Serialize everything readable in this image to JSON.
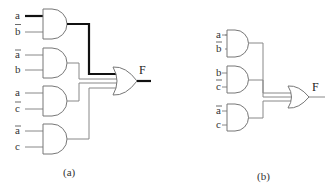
{
  "diagram": {
    "type": "logic-circuit-comparison",
    "panels": [
      {
        "caption": "(a)",
        "output_label": "F",
        "and_gates": [
          {
            "inputs": [
              {
                "label": "a",
                "complemented": false
              },
              {
                "label": "b",
                "complemented": true
              }
            ],
            "highlighted": true
          },
          {
            "inputs": [
              {
                "label": "a",
                "complemented": true
              },
              {
                "label": "b",
                "complemented": false
              }
            ],
            "highlighted": false
          },
          {
            "inputs": [
              {
                "label": "a",
                "complemented": false
              },
              {
                "label": "c",
                "complemented": true
              }
            ],
            "highlighted": false
          },
          {
            "inputs": [
              {
                "label": "a",
                "complemented": true
              },
              {
                "label": "c",
                "complemented": false
              }
            ],
            "highlighted": false
          }
        ],
        "or_gate_inputs": 4
      },
      {
        "caption": "(b)",
        "output_label": "F",
        "and_gates": [
          {
            "inputs": [
              {
                "label": "a",
                "complemented": false
              },
              {
                "label": "b",
                "complemented": true
              }
            ]
          },
          {
            "inputs": [
              {
                "label": "b",
                "complemented": false
              },
              {
                "label": "c",
                "complemented": true
              }
            ]
          },
          {
            "inputs": [
              {
                "label": "a",
                "complemented": true
              },
              {
                "label": "c",
                "complemented": false
              }
            ]
          }
        ],
        "or_gate_inputs": 3
      }
    ]
  },
  "panel_a": {
    "caption": "(a)",
    "output": "F",
    "g1": {
      "in1": "a",
      "in2": "b"
    },
    "g2": {
      "in1": "a",
      "in2": "b"
    },
    "g3": {
      "in1": "a",
      "in2": "c"
    },
    "g4": {
      "in1": "a",
      "in2": "c"
    }
  },
  "panel_b": {
    "caption": "(b)",
    "output": "F",
    "g1": {
      "in1": "a",
      "in2": "b"
    },
    "g2": {
      "in1": "b",
      "in2": "c"
    },
    "g3": {
      "in1": "a",
      "in2": "c"
    }
  },
  "colors": {
    "wire": "#888888",
    "highlight_wire": "#111111",
    "gate_stroke": "#777777",
    "text": "#333333"
  }
}
